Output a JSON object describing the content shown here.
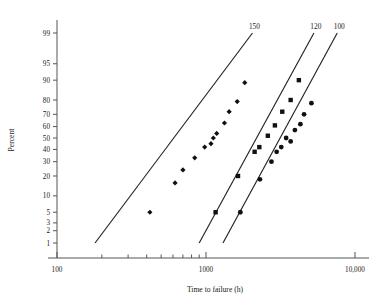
{
  "chart_data": {
    "type": "scatter",
    "title": "",
    "xlabel": "Time to failure (h)",
    "ylabel": "Percent",
    "xscale": "log",
    "yscale": "probability",
    "xlim": [
      100,
      10000
    ],
    "ylim": [
      1,
      99
    ],
    "grid": false,
    "legend_position": "inline-top",
    "x_ticks": [
      100,
      1000,
      10000
    ],
    "x_tick_labels": [
      "100",
      "1000",
      "10,000"
    ],
    "y_ticks": [
      1,
      2,
      3,
      5,
      10,
      20,
      30,
      40,
      50,
      60,
      70,
      80,
      90,
      95,
      99
    ],
    "y_tick_labels": [
      "1",
      "2",
      "3",
      "5",
      "10",
      "20",
      "30",
      "40",
      "50",
      "60",
      "70",
      "80",
      "90",
      "95",
      "99"
    ],
    "series": [
      {
        "name": "150",
        "label": "150",
        "marker": "diamond",
        "color": "#111111",
        "fit_line": {
          "x": [
            180,
            2050
          ],
          "y": [
            1.0,
            99.0
          ]
        },
        "points": [
          {
            "x": 420,
            "y": 5.0
          },
          {
            "x": 620,
            "y": 16.0
          },
          {
            "x": 700,
            "y": 24.0
          },
          {
            "x": 840,
            "y": 33.0
          },
          {
            "x": 980,
            "y": 42.0
          },
          {
            "x": 1080,
            "y": 45.0
          },
          {
            "x": 1120,
            "y": 50.0
          },
          {
            "x": 1180,
            "y": 54.0
          },
          {
            "x": 1330,
            "y": 63.0
          },
          {
            "x": 1430,
            "y": 72.0
          },
          {
            "x": 1620,
            "y": 79.0
          },
          {
            "x": 1820,
            "y": 89.0
          }
        ]
      },
      {
        "name": "120",
        "label": "120",
        "marker": "square",
        "color": "#111111",
        "fit_line": {
          "x": [
            900,
            5300
          ],
          "y": [
            1.0,
            99.0
          ]
        },
        "points": [
          {
            "x": 1160,
            "y": 5.0
          },
          {
            "x": 1640,
            "y": 20.0
          },
          {
            "x": 2120,
            "y": 38.0
          },
          {
            "x": 2280,
            "y": 42.0
          },
          {
            "x": 2600,
            "y": 52.0
          },
          {
            "x": 2900,
            "y": 61.0
          },
          {
            "x": 3250,
            "y": 72.0
          },
          {
            "x": 3700,
            "y": 80.0
          },
          {
            "x": 4200,
            "y": 90.0
          }
        ]
      },
      {
        "name": "100",
        "label": "100",
        "marker": "circle",
        "color": "#111111",
        "fit_line": {
          "x": [
            1300,
            7600
          ],
          "y": [
            1.0,
            99.0
          ]
        },
        "points": [
          {
            "x": 1700,
            "y": 5.0
          },
          {
            "x": 2300,
            "y": 18.0
          },
          {
            "x": 2750,
            "y": 30.0
          },
          {
            "x": 2980,
            "y": 38.0
          },
          {
            "x": 3200,
            "y": 42.0
          },
          {
            "x": 3450,
            "y": 50.0
          },
          {
            "x": 3700,
            "y": 47.0
          },
          {
            "x": 3950,
            "y": 57.0
          },
          {
            "x": 4300,
            "y": 62.0
          },
          {
            "x": 4550,
            "y": 70.0
          },
          {
            "x": 5100,
            "y": 78.0
          }
        ]
      }
    ]
  },
  "axes": {
    "y_title": "Percent",
    "x_title": "Time to failure (h)"
  }
}
